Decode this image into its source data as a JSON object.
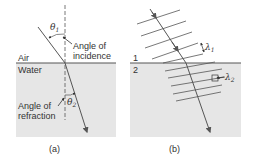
{
  "colors": {
    "water": "#e6e6e6",
    "line": "#555555",
    "text": "#333333",
    "background": "#ffffff"
  },
  "panel_a": {
    "caption": "(a)",
    "medium_top": "Air",
    "medium_bottom": "Water",
    "theta1": "θ",
    "theta1_sub": "1",
    "theta2": "θ",
    "theta2_sub": "2",
    "incidence_label_line1": "Angle of",
    "incidence_label_line2": "incidence",
    "refraction_label_line1": "Angle of",
    "refraction_label_line2": "refraction"
  },
  "panel_b": {
    "caption": "(b)",
    "medium_top": "1",
    "medium_bottom": "2",
    "lambda1": "λ",
    "lambda1_sub": "1",
    "lambda2": "λ",
    "lambda2_sub": "2"
  }
}
